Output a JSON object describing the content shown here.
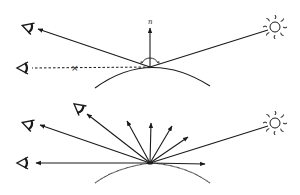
{
  "diagram": {
    "colors": {
      "stroke": "#1a1a1a",
      "background": "#ffffff"
    },
    "specular": {
      "normal_label": "n",
      "reflection_point": [
        150,
        67
      ],
      "light_source": {
        "icon": "sun-icon",
        "position": [
          275,
          27
        ]
      },
      "observers": [
        {
          "icon": "eye-icon",
          "position": [
            27,
            27
          ],
          "sees_reflection": true
        },
        {
          "icon": "eye-icon",
          "position": [
            22,
            68
          ],
          "sees_reflection": false
        }
      ],
      "blocked_marker": "×"
    },
    "diffuse": {
      "reflection_point": [
        150,
        163
      ],
      "light_source": {
        "icon": "sun-icon",
        "position": [
          275,
          123
        ]
      },
      "observers": [
        {
          "icon": "eye-icon",
          "position": [
            27,
            124
          ]
        },
        {
          "icon": "eye-icon",
          "position": [
            78,
            107
          ]
        },
        {
          "icon": "eye-icon",
          "position": [
            22,
            163
          ]
        }
      ],
      "scatter_rays": 8
    }
  }
}
